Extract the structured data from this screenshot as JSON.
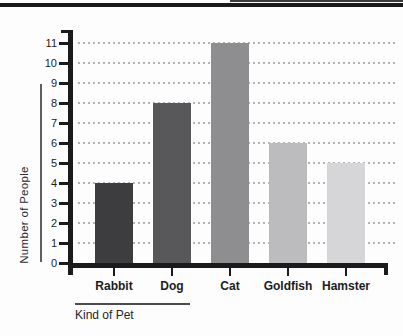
{
  "chart_data": {
    "type": "bar",
    "title": "",
    "categories": [
      "Rabbit",
      "Dog",
      "Cat",
      "Goldfish",
      "Hamster"
    ],
    "values": [
      4,
      8,
      11,
      6,
      5
    ],
    "bar_colors": [
      "#3d3d3f",
      "#58585a",
      "#8e8e90",
      "#bcbcbe",
      "#d6d6d8"
    ],
    "xlabel": "Kind of Pet",
    "ylabel": "Number of People",
    "y_ticks": [
      0,
      1,
      2,
      3,
      4,
      5,
      6,
      7,
      8,
      9,
      10,
      11
    ],
    "ylim": [
      0,
      11
    ],
    "grid": "dotted-horizontal",
    "legend": "none",
    "axis_color": "#1b1b1c",
    "grid_color": "#b4b4b6"
  }
}
